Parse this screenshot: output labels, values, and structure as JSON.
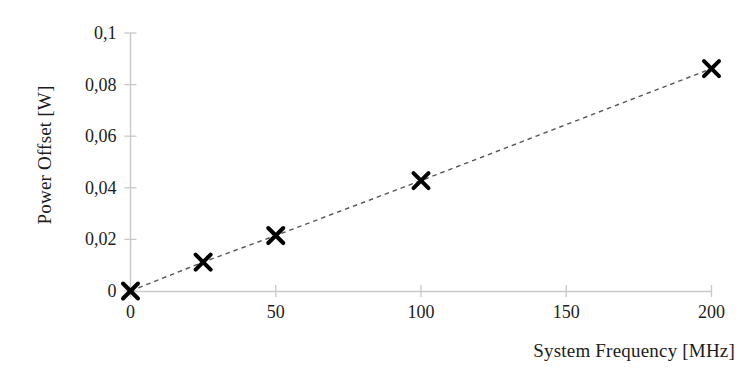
{
  "chart_data": {
    "type": "scatter",
    "title": "",
    "xlabel": "System Frequency [MHz]",
    "ylabel": "Power Offset [W]",
    "x": [
      0,
      25,
      50,
      100,
      200
    ],
    "values": [
      0,
      0.0112,
      0.0215,
      0.0428,
      0.0862
    ],
    "series": [
      {
        "name": "Power Offset",
        "x": [
          0,
          25,
          50,
          100,
          200
        ],
        "values": [
          0,
          0.0112,
          0.0215,
          0.0428,
          0.0862
        ],
        "marker": "x",
        "marker_color": "#000000",
        "line_style": "dashed",
        "line_color": "#555555"
      }
    ],
    "xlim": [
      0,
      200
    ],
    "ylim": [
      0,
      0.1
    ],
    "xticks": [
      0,
      50,
      100,
      150,
      200
    ],
    "yticks": [
      0,
      0.02,
      0.04,
      0.06,
      0.08,
      0.1
    ],
    "xtick_labels": [
      "0",
      "50",
      "100",
      "150",
      "200"
    ],
    "ytick_labels": [
      "0",
      "0,02",
      "0,04",
      "0,06",
      "0,08",
      "0,1"
    ],
    "grid": false,
    "legend": null,
    "decimal_separator": ",",
    "axis_color": "#c8c8c8",
    "text_color": "#1c1c1c",
    "background": "#ffffff"
  }
}
